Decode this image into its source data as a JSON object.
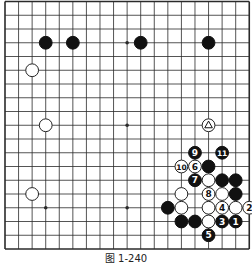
{
  "figure": {
    "caption": "图 1-240",
    "board_size": 19
  },
  "colors": {
    "line": "#2a2a2a",
    "black_stone": "#111111",
    "white_stone": "#ffffff",
    "background": "#ffffff"
  },
  "star_points": [
    [
      3,
      3
    ],
    [
      9,
      3
    ],
    [
      15,
      3
    ],
    [
      3,
      9
    ],
    [
      9,
      9
    ],
    [
      15,
      9
    ],
    [
      3,
      15
    ],
    [
      9,
      15
    ],
    [
      15,
      15
    ]
  ],
  "stones": [
    {
      "col": 3,
      "row": 3,
      "color": "black",
      "label": ""
    },
    {
      "col": 5,
      "row": 3,
      "color": "black",
      "label": ""
    },
    {
      "col": 10,
      "row": 3,
      "color": "black",
      "label": ""
    },
    {
      "col": 15,
      "row": 3,
      "color": "black",
      "label": ""
    },
    {
      "col": 2,
      "row": 5,
      "color": "white",
      "label": ""
    },
    {
      "col": 3,
      "row": 9,
      "color": "white",
      "label": ""
    },
    {
      "col": 15,
      "row": 9,
      "color": "white",
      "label": "",
      "mark": "triangle"
    },
    {
      "col": 2,
      "row": 14,
      "color": "white",
      "label": ""
    },
    {
      "col": 14,
      "row": 11,
      "color": "black",
      "label": "9"
    },
    {
      "col": 16,
      "row": 11,
      "color": "black",
      "label": "11"
    },
    {
      "col": 13,
      "row": 12,
      "color": "white",
      "label": "10"
    },
    {
      "col": 14,
      "row": 12,
      "color": "white",
      "label": "6"
    },
    {
      "col": 15,
      "row": 12,
      "color": "black",
      "label": ""
    },
    {
      "col": 14,
      "row": 13,
      "color": "black",
      "label": "7"
    },
    {
      "col": 15,
      "row": 13,
      "color": "white",
      "label": ""
    },
    {
      "col": 16,
      "row": 13,
      "color": "black",
      "label": ""
    },
    {
      "col": 17,
      "row": 13,
      "color": "black",
      "label": ""
    },
    {
      "col": 13,
      "row": 14,
      "color": "white",
      "label": ""
    },
    {
      "col": 15,
      "row": 14,
      "color": "white",
      "label": "8"
    },
    {
      "col": 16,
      "row": 14,
      "color": "white",
      "label": ""
    },
    {
      "col": 17,
      "row": 14,
      "color": "black",
      "label": ""
    },
    {
      "col": 12,
      "row": 15,
      "color": "black",
      "label": ""
    },
    {
      "col": 13,
      "row": 15,
      "color": "white",
      "label": ""
    },
    {
      "col": 15,
      "row": 15,
      "color": "white",
      "label": ""
    },
    {
      "col": 16,
      "row": 15,
      "color": "white",
      "label": "4"
    },
    {
      "col": 17,
      "row": 15,
      "color": "white",
      "label": ""
    },
    {
      "col": 18,
      "row": 15,
      "color": "white",
      "label": "2"
    },
    {
      "col": 13,
      "row": 16,
      "color": "black",
      "label": ""
    },
    {
      "col": 14,
      "row": 16,
      "color": "black",
      "label": ""
    },
    {
      "col": 15,
      "row": 16,
      "color": "white",
      "label": ""
    },
    {
      "col": 16,
      "row": 16,
      "color": "black",
      "label": "3"
    },
    {
      "col": 17,
      "row": 16,
      "color": "black",
      "label": "1"
    },
    {
      "col": 15,
      "row": 17,
      "color": "black",
      "label": "5"
    }
  ]
}
